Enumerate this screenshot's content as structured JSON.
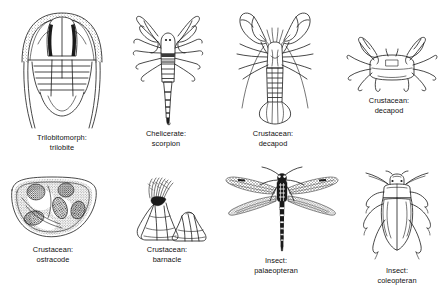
{
  "plate": {
    "title": "Arthropod body-plan plate",
    "background_color": "#ffffff",
    "ink_color": "#1a1a1a",
    "columns": 4,
    "rows": 2
  },
  "figures": [
    {
      "id": "trilobite",
      "group_label": "Trilobitomorph:",
      "taxon_label": "trilobite",
      "icon": "trilobite-icon",
      "row": 1,
      "column": 1,
      "caption_x": 62,
      "caption_y": 133
    },
    {
      "id": "scorpion",
      "group_label": "Chelicerate:",
      "taxon_label": "scorpion",
      "icon": "scorpion-icon",
      "row": 1,
      "column": 2,
      "caption_x": 166,
      "caption_y": 129
    },
    {
      "id": "lobster",
      "group_label": "Crustacean:",
      "taxon_label": "decapod",
      "icon": "lobster-icon",
      "row": 1,
      "column": 3,
      "caption_x": 273,
      "caption_y": 129
    },
    {
      "id": "crab",
      "group_label": "Crustacean:",
      "taxon_label": "decapod",
      "icon": "crab-icon",
      "row": 1,
      "column": 4,
      "caption_x": 389,
      "caption_y": 96
    },
    {
      "id": "ostracode",
      "group_label": "Crustacean:",
      "taxon_label": "ostracode",
      "icon": "ostracode-icon",
      "row": 2,
      "column": 1,
      "caption_x": 53,
      "caption_y": 245
    },
    {
      "id": "barnacle",
      "group_label": "Crustacean:",
      "taxon_label": "barnacle",
      "icon": "barnacle-icon",
      "row": 2,
      "column": 2,
      "caption_x": 167,
      "caption_y": 245
    },
    {
      "id": "palaeopteran",
      "group_label": "Insect:",
      "taxon_label": "palaeopteran",
      "icon": "dragonfly-icon",
      "row": 2,
      "column": 3,
      "caption_x": 276,
      "caption_y": 256
    },
    {
      "id": "coleopteran",
      "group_label": "Insect:",
      "taxon_label": "coleopteran",
      "icon": "beetle-icon",
      "row": 2,
      "column": 4,
      "caption_x": 397,
      "caption_y": 266
    }
  ]
}
